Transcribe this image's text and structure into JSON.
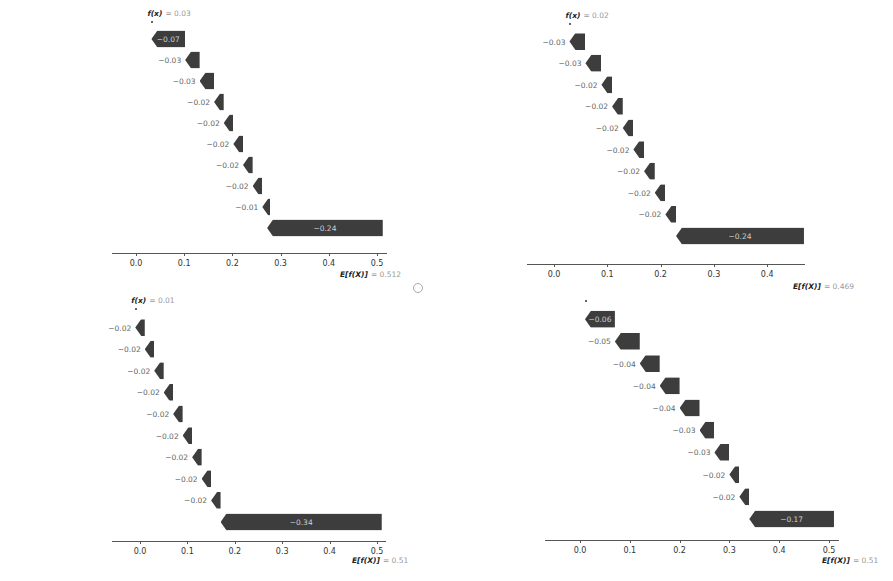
{
  "colors": {
    "bar": "#3d3d3d",
    "bar_label": "#cfcfcf",
    "feature_value": "#9a9a9a",
    "feature_name": "#2a2a2a"
  },
  "chart_data": [
    {
      "type": "bar",
      "subtype": "shap-waterfall",
      "fx_label": "f(x)",
      "fx_value": "= 0.03",
      "ex_label": "E[f(X)]",
      "ex_value": "= 0.512",
      "xticks": [
        "0.0",
        "0.1",
        "0.2",
        "0.3",
        "0.4",
        "0.5"
      ],
      "xlim": [
        -0.05,
        0.52
      ],
      "features": [
        {
          "value": "0.108",
          "name": "guangdong",
          "shap": -0.07,
          "label": "−0.07"
        },
        {
          "value": "0",
          "name": "has",
          "shap": -0.03,
          "label": "−0.03"
        },
        {
          "value": "0.046",
          "name": "lack",
          "shap": -0.03,
          "label": "−0.03"
        },
        {
          "value": "0.156",
          "name": "less",
          "shap": -0.02,
          "label": "−0.02"
        },
        {
          "value": "0",
          "name": "thoughtful",
          "shap": -0.02,
          "label": "−0.02"
        },
        {
          "value": "0.059",
          "name": "difficult",
          "shap": -0.02,
          "label": "−0.02"
        },
        {
          "value": "0.058",
          "name": "hesitant",
          "shap": -0.02,
          "label": "−0.02"
        },
        {
          "value": "0.025",
          "name": "service",
          "shap": -0.02,
          "label": "−0.02"
        },
        {
          "value": "0.024",
          "name": "wechat",
          "shap": -0.01,
          "label": "−0.01"
        },
        {
          "value": "",
          "name": "675 other features",
          "shap": -0.24,
          "label": "−0.24"
        }
      ]
    },
    {
      "type": "bar",
      "subtype": "shap-waterfall",
      "fx_label": "f(x)",
      "fx_value": "= 0.02",
      "ex_label": "E[f(X)]",
      "ex_value": "= 0.469",
      "xticks": [
        "0.0",
        "0.1",
        "0.2",
        "0.3",
        "0.4"
      ],
      "xlim": [
        -0.05,
        0.47
      ],
      "features": [
        {
          "value": "0.045",
          "name": "context",
          "shap": -0.03,
          "label": "−0.03"
        },
        {
          "value": "0",
          "name": "summary",
          "shap": -0.03,
          "label": "−0.03"
        },
        {
          "value": "0",
          "name": "having",
          "shap": -0.02,
          "label": "−0.02"
        },
        {
          "value": "0.039",
          "name": "participant",
          "shap": -0.02,
          "label": "−0.02"
        },
        {
          "value": "0.071",
          "name": "was",
          "shap": -0.02,
          "label": "−0.02"
        },
        {
          "value": "0.069",
          "name": "guangdong",
          "shap": -0.02,
          "label": "−0.02"
        },
        {
          "value": "0.075",
          "name": "should",
          "shap": -0.02,
          "label": "−0.02"
        },
        {
          "value": "0",
          "name": "ensures",
          "shap": -0.02,
          "label": "−0.02"
        },
        {
          "value": "0.069",
          "name": "trying",
          "shap": -0.02,
          "label": "−0.02"
        },
        {
          "value": "",
          "name": "937 other features",
          "shap": -0.24,
          "label": "−0.24"
        }
      ]
    },
    {
      "type": "bar",
      "subtype": "shap-waterfall",
      "fx_label": "f(x)",
      "fx_value": "= 0.01",
      "ex_label": "E[f(X)]",
      "ex_value": "= 0.51",
      "xticks": [
        "0.0",
        "0.1",
        "0.2",
        "0.3",
        "0.4",
        "0.5"
      ],
      "xlim": [
        -0.06,
        0.52
      ],
      "features": [
        {
          "value": "0.045",
          "name": "left",
          "shap": -0.02,
          "label": "−0.02"
        },
        {
          "value": "0.027",
          "name": "stark",
          "shap": -0.02,
          "label": "−0.02"
        },
        {
          "value": "0.067",
          "name": "how",
          "shap": -0.02,
          "label": "−0.02"
        },
        {
          "value": "0.029",
          "name": "severely",
          "shap": -0.02,
          "label": "−0.02"
        },
        {
          "value": "0",
          "name": "also",
          "shap": -0.02,
          "label": "−0.02"
        },
        {
          "value": "0.071",
          "name": "trying",
          "shap": -0.02,
          "label": "−0.02"
        },
        {
          "value": "0.029",
          "name": "damaged",
          "shap": -0.02,
          "label": "−0.02"
        },
        {
          "value": "0.03",
          "name": "this",
          "shap": -0.02,
          "label": "−0.02"
        },
        {
          "value": "0.029",
          "name": "should",
          "shap": -0.02,
          "label": "−0.02"
        },
        {
          "value": "",
          "name": "488 other features",
          "shap": -0.34,
          "label": "−0.34"
        }
      ]
    },
    {
      "type": "bar",
      "subtype": "shap-waterfall",
      "fx_label": "",
      "fx_value": "",
      "ex_label": "E[f(X)]",
      "ex_value": "= 0.51",
      "xticks": [
        "0.0",
        "0.1",
        "0.2",
        "0.3",
        "0.4",
        "0.5"
      ],
      "xlim": [
        -0.07,
        0.52
      ],
      "features": [
        {
          "value": "0.066",
          "name": "dissatisfied",
          "shap": -0.06,
          "label": "−0.06"
        },
        {
          "value": "0.074",
          "name": "lack",
          "shap": -0.05,
          "label": "−0.05"
        },
        {
          "value": "0.057",
          "name": "participant",
          "shap": -0.04,
          "label": "−0.04"
        },
        {
          "value": "0.294",
          "name": "was",
          "shap": -0.04,
          "label": "−0.04"
        },
        {
          "value": "0.151",
          "name": "left",
          "shap": -0.04,
          "label": "−0.04"
        },
        {
          "value": "0.095",
          "name": "disappointed",
          "shap": -0.03,
          "label": "−0.03"
        },
        {
          "value": "0.063",
          "name": "context",
          "shap": -0.03,
          "label": "−0.03"
        },
        {
          "value": "0.099",
          "name": "felt",
          "shap": -0.02,
          "label": "−0.02"
        },
        {
          "value": "0",
          "name": "this",
          "shap": -0.02,
          "label": "−0.02"
        },
        {
          "value": "",
          "name": "571 other features",
          "shap": -0.17,
          "label": "−0.17"
        }
      ]
    }
  ]
}
